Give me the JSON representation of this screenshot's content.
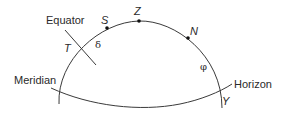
{
  "diagram": {
    "type": "celestial-sphere-section",
    "colors": {
      "line": "#3a3a3a",
      "text": "#2a2a2a",
      "point": "#111111",
      "background": "#ffffff"
    },
    "labels": {
      "equator": "Equator",
      "meridian": "Meridian",
      "horizon": "Horizon"
    },
    "points": {
      "S": "S",
      "Z": "Z",
      "N": "N",
      "T": "T",
      "Y": "Y"
    },
    "angles": {
      "delta": "δ",
      "phi": "φ"
    }
  }
}
